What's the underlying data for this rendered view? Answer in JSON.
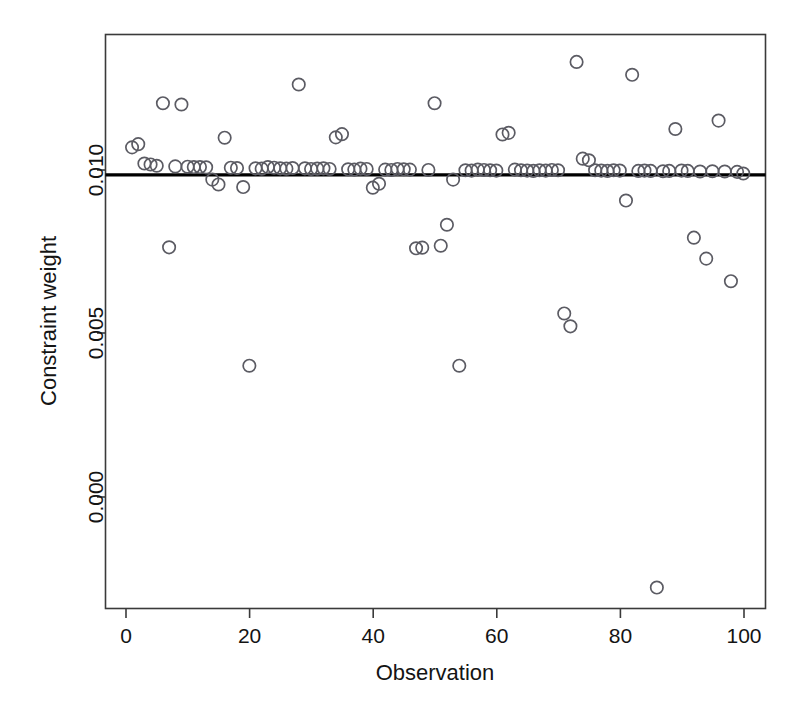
{
  "chart_data": {
    "type": "scatter",
    "title": "",
    "xlabel": "Observation",
    "ylabel": "Constraint weight",
    "xlim": [
      -3.3,
      103.6
    ],
    "ylim": [
      -0.00345,
      0.01435
    ],
    "xticks": [
      0,
      20,
      40,
      60,
      80,
      100
    ],
    "xticklabels": [
      "0",
      "20",
      "40",
      "60",
      "80",
      "100"
    ],
    "yticks": [
      0.0,
      0.005,
      0.01
    ],
    "yticklabels": [
      "0.000",
      "0.005",
      "0.010"
    ],
    "grid": false,
    "legend": null,
    "marker": "open-circle",
    "marker_color": "#5b5b63",
    "reference_line": {
      "orientation": "horizontal",
      "value": 0.01,
      "color": "#000000",
      "width_px": 3.2
    },
    "x": [
      1,
      2,
      3,
      4,
      5,
      6,
      7,
      8,
      9,
      10,
      11,
      12,
      13,
      14,
      15,
      16,
      17,
      18,
      19,
      20,
      21,
      22,
      23,
      24,
      25,
      26,
      27,
      28,
      29,
      30,
      31,
      32,
      33,
      34,
      35,
      36,
      37,
      38,
      39,
      40,
      41,
      42,
      43,
      44,
      45,
      46,
      47,
      48,
      49,
      50,
      51,
      52,
      53,
      54,
      55,
      56,
      57,
      58,
      59,
      60,
      61,
      62,
      63,
      64,
      65,
      66,
      67,
      68,
      69,
      70,
      71,
      72,
      73,
      74,
      75,
      76,
      77,
      78,
      79,
      80,
      81,
      82,
      83,
      84,
      85,
      86,
      87,
      88,
      89,
      90,
      91,
      92,
      93,
      94,
      95,
      96,
      97,
      98,
      99,
      100
    ],
    "y": [
      0.01085,
      0.01095,
      0.01035,
      0.01032,
      0.01028,
      0.01222,
      0.00775,
      0.01026,
      0.01218,
      0.01025,
      0.01024,
      0.01024,
      0.01023,
      0.00985,
      0.0097,
      0.01115,
      0.01022,
      0.01021,
      0.00962,
      0.00408,
      0.0102,
      0.01019,
      0.01024,
      0.01022,
      0.0102,
      0.01019,
      0.01021,
      0.0128,
      0.0102,
      0.01018,
      0.01019,
      0.0102,
      0.01018,
      0.01116,
      0.01126,
      0.01017,
      0.01016,
      0.01019,
      0.01018,
      0.0096,
      0.00972,
      0.01016,
      0.01015,
      0.01018,
      0.01017,
      0.01016,
      0.00772,
      0.00774,
      0.01015,
      0.01222,
      0.0078,
      0.00845,
      0.00985,
      0.00408,
      0.01014,
      0.01013,
      0.01016,
      0.01015,
      0.01014,
      0.01013,
      0.01125,
      0.0113,
      0.01016,
      0.01014,
      0.01013,
      0.01012,
      0.01014,
      0.01013,
      0.01015,
      0.01014,
      0.0057,
      0.0053,
      0.0135,
      0.0105,
      0.01045,
      0.01014,
      0.01013,
      0.01012,
      0.01014,
      0.01013,
      0.0092,
      0.0131,
      0.01012,
      0.01013,
      0.01012,
      -0.0028,
      0.01011,
      0.01012,
      0.01142,
      0.01013,
      0.01012,
      0.00805,
      0.0101,
      0.0074,
      0.01011,
      0.01168,
      0.0101,
      0.0067,
      0.01009,
      0.01004
    ],
    "n_points": 100
  },
  "axis": {
    "y_label": "Constraint weight",
    "x_label": "Observation",
    "x_tick_labels": [
      "0",
      "20",
      "40",
      "60",
      "80",
      "100"
    ],
    "y_tick_labels": [
      "0.000",
      "0.005",
      "0.010"
    ]
  }
}
